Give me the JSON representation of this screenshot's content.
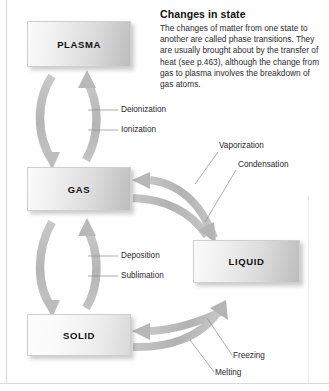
{
  "note": {
    "heading": "Changes in state",
    "body": "The changes of matter from one state to another are called phase transitions. They are usually brought about by the transfer of heat (see p.463), although the change from gas to plasma involves the breakdown of gas atoms."
  },
  "states": [
    {
      "id": "plasma",
      "label": "PLASMA"
    },
    {
      "id": "gas",
      "label": "GAS"
    },
    {
      "id": "liquid",
      "label": "LIQUID"
    },
    {
      "id": "solid",
      "label": "SOLID"
    }
  ],
  "transitions": [
    {
      "id": "deionization",
      "label": "Deionization",
      "from": "PLASMA",
      "to": "GAS"
    },
    {
      "id": "ionization",
      "label": "Ionization",
      "from": "GAS",
      "to": "PLASMA"
    },
    {
      "id": "vaporization",
      "label": "Vaporization",
      "from": "LIQUID",
      "to": "GAS"
    },
    {
      "id": "condensation",
      "label": "Condensation",
      "from": "GAS",
      "to": "LIQUID"
    },
    {
      "id": "deposition",
      "label": "Deposition",
      "from": "GAS",
      "to": "SOLID"
    },
    {
      "id": "sublimation",
      "label": "Sublimation",
      "from": "SOLID",
      "to": "GAS"
    },
    {
      "id": "freezing",
      "label": "Freezing",
      "from": "LIQUID",
      "to": "SOLID"
    },
    {
      "id": "melting",
      "label": "Melting",
      "from": "SOLID",
      "to": "LIQUID"
    }
  ],
  "colors": {
    "arrow": "#b8b8b8",
    "arrow_dark": "#a8a8a8",
    "box_light": "#fbfbfb",
    "box_dark": "#bdbdbd",
    "text": "#111111",
    "leader": "#8a8a8a"
  }
}
